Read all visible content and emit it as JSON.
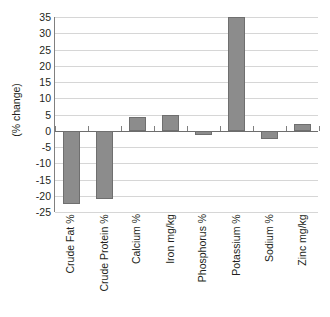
{
  "chart_data": {
    "type": "bar",
    "title": "",
    "subtitle": "",
    "xlabel": "",
    "ylabel": "(% change)",
    "categories": [
      "Crude Fat %",
      "Crude Protein %",
      "Calcium %",
      "Iron mg/kg",
      "Phosphorus %",
      "Potassium %",
      "Sodium %",
      "Zinc mg/kg"
    ],
    "values": [
      -22.5,
      -21.0,
      4.2,
      5.0,
      -1.2,
      35.0,
      -2.5,
      2.2
    ],
    "series": [
      {
        "name": "% change",
        "values": [
          -22.5,
          -21.0,
          4.2,
          5.0,
          -1.2,
          35.0,
          -2.5,
          2.2
        ]
      }
    ],
    "ylim": [
      -25,
      35
    ],
    "ytick_step": 5,
    "ytick_labels": [
      "35",
      "30",
      "25",
      "20",
      "15",
      "10",
      "5",
      "0",
      "-5",
      "-10",
      "-15",
      "-20",
      "-25"
    ],
    "ytick_values": [
      35,
      30,
      25,
      20,
      15,
      10,
      5,
      0,
      -5,
      -10,
      -15,
      -20,
      -25
    ],
    "grid": true,
    "legend": false,
    "legend_position": "none",
    "bar_color": "#8c8c8c",
    "bar_edge_color": "#6f6f6f",
    "grid_color": "#d6d6d6",
    "axis_color": "#808080",
    "text_color": "#231f20",
    "background": "#ffffff",
    "annotations": []
  }
}
